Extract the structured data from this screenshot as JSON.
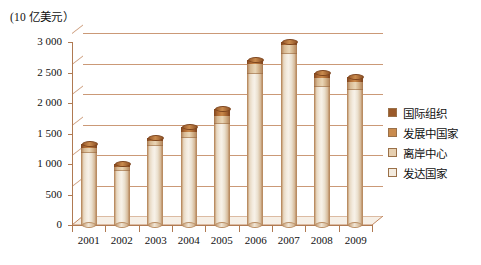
{
  "chart_data": {
    "type": "bar",
    "title": "",
    "unit_caption": "(10 亿美元）",
    "xlabel": "",
    "ylabel": "",
    "ylim": [
      0,
      3000
    ],
    "ytick_values": [
      0,
      500,
      1000,
      1500,
      2000,
      2500,
      3000
    ],
    "ytick_labels": [
      "0",
      "500",
      "1 000",
      "1 500",
      "2 000",
      "2 500",
      "3 000"
    ],
    "grid": true,
    "legend_position": "right",
    "categories": [
      "2001",
      "2002",
      "2003",
      "2004",
      "2005",
      "2006",
      "2007",
      "2008",
      "2009"
    ],
    "series": [
      {
        "name": "发达国家",
        "color": "#f3ebdf",
        "values": [
          1180,
          880,
          1300,
          1420,
          1660,
          2480,
          2800,
          2270,
          2210
        ]
      },
      {
        "name": "离岸中心",
        "color": "#e6cfb0",
        "values": [
          30,
          25,
          30,
          35,
          40,
          55,
          60,
          50,
          45
        ]
      },
      {
        "name": "发展中国家",
        "color": "#c98b4e",
        "values": [
          60,
          50,
          55,
          75,
          90,
          100,
          95,
          90,
          85
        ]
      },
      {
        "name": "国际组织",
        "color": "#9a5a2a",
        "values": [
          50,
          45,
          45,
          70,
          110,
          65,
          45,
          90,
          90
        ]
      }
    ],
    "totals": [
      1320,
      1000,
      1430,
      1600,
      1900,
      2700,
      3000,
      2500,
      2430
    ]
  },
  "legend": {
    "items": [
      {
        "label": "国际组织",
        "color": "#9a5a2a"
      },
      {
        "label": "发展中国家",
        "color": "#c98b4e"
      },
      {
        "label": "离岸中心",
        "color": "#e6cfb0"
      },
      {
        "label": "发达国家",
        "color": "#f3ebdf"
      }
    ]
  },
  "axes": {
    "unit_caption": "(10 亿美元）",
    "y_ticks": [
      "3 000",
      "2 500",
      "2 000",
      "1 500",
      "1 000",
      "500",
      "0"
    ],
    "x_ticks": [
      "2001",
      "2002",
      "2003",
      "2004",
      "2005",
      "2006",
      "2007",
      "2008",
      "2009"
    ]
  },
  "colors": {
    "grid": "#c2875f",
    "axis": "#b07a52",
    "cap": "#9a5a2a",
    "body": "#f3ebdf",
    "text": "#111111",
    "background": "#ffffff"
  }
}
